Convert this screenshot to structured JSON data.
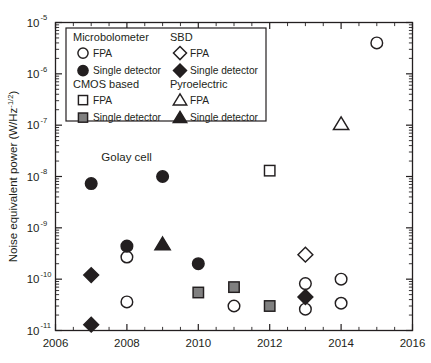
{
  "chart_data": {
    "type": "scatter",
    "title": "",
    "xlabel": "",
    "ylabel": "Noise equivalent power (W/Hz",
    "ylabel_sup": "-1/2",
    "ylabel_tail": ")",
    "xlim": [
      2006,
      2016
    ],
    "ylim": [
      1e-11,
      1e-05
    ],
    "yscale": "log",
    "xticks": [
      "2006",
      "2008",
      "2010",
      "2012",
      "2014",
      "2016"
    ],
    "xtick_values": [
      2006,
      2008,
      2010,
      2012,
      2014,
      2016
    ],
    "ytick_labels": [
      "10",
      "10",
      "10",
      "10",
      "10",
      "10",
      "10"
    ],
    "ytick_exponents": [
      "-5",
      "-6",
      "-7",
      "-8",
      "-9",
      "-10",
      "-11"
    ],
    "ytick_values": [
      1e-05,
      1e-06,
      1e-07,
      1e-08,
      1e-09,
      1e-10,
      1e-11
    ],
    "grid": false,
    "annotations": [
      {
        "text": "Golay cell",
        "x": 2009,
        "y": 1e-08,
        "dx": -36,
        "dy": -16
      }
    ],
    "legend_position": "upper-left-inside",
    "colors": {
      "outline": "#231f20",
      "filled": "#231f20",
      "grey_fill": "#808080",
      "open_fill": "#ffffff"
    },
    "series": [
      {
        "name": "Microbolometer FPA",
        "marker": "circle",
        "fill": "open",
        "points": [
          {
            "x": 2008,
            "y": 2.7e-10
          },
          {
            "x": 2008,
            "y": 3.6e-11
          },
          {
            "x": 2011,
            "y": 3e-11
          },
          {
            "x": 2013,
            "y": 8.2e-11
          },
          {
            "x": 2013,
            "y": 2.6e-11
          },
          {
            "x": 2014,
            "y": 1e-10
          },
          {
            "x": 2014,
            "y": 3.4e-11
          },
          {
            "x": 2015,
            "y": 4e-06
          }
        ]
      },
      {
        "name": "Microbolometer Single detector",
        "marker": "circle",
        "fill": "filled",
        "points": [
          {
            "x": 2007,
            "y": 7.3e-09
          },
          {
            "x": 2008,
            "y": 4.4e-10
          },
          {
            "x": 2009,
            "y": 1e-08
          },
          {
            "x": 2010,
            "y": 2e-10
          }
        ]
      },
      {
        "name": "CMOS based FPA",
        "marker": "square",
        "fill": "open",
        "points": [
          {
            "x": 2012,
            "y": 1.3e-08
          }
        ]
      },
      {
        "name": "CMOS based Single detector",
        "marker": "square",
        "fill": "grey",
        "points": [
          {
            "x": 2010,
            "y": 5.5e-11
          },
          {
            "x": 2011,
            "y": 7e-11
          },
          {
            "x": 2012,
            "y": 3e-11
          }
        ]
      },
      {
        "name": "SBD FPA",
        "marker": "diamond",
        "fill": "open",
        "points": [
          {
            "x": 2013,
            "y": 3e-10
          }
        ]
      },
      {
        "name": "SBD Single detector",
        "marker": "diamond",
        "fill": "filled",
        "points": [
          {
            "x": 2007,
            "y": 1.2e-10
          },
          {
            "x": 2007,
            "y": 1.3e-11
          },
          {
            "x": 2013,
            "y": 4.5e-11
          }
        ]
      },
      {
        "name": "Pyroelectric FPA",
        "marker": "triangle",
        "fill": "open",
        "points": [
          {
            "x": 2014,
            "y": 1.05e-07
          }
        ]
      },
      {
        "name": "Pyroelectric Single detector",
        "marker": "triangle",
        "fill": "filled",
        "points": [
          {
            "x": 2009,
            "y": 4.8e-10
          }
        ]
      }
    ],
    "legend": {
      "groups": [
        {
          "heading": "Microbolometer",
          "items": [
            {
              "label": "FPA",
              "marker": "circle",
              "fill": "open"
            },
            {
              "label": "Single detector",
              "marker": "circle",
              "fill": "filled"
            }
          ]
        },
        {
          "heading": "SBD",
          "items": [
            {
              "label": "FPA",
              "marker": "diamond",
              "fill": "open"
            },
            {
              "label": "Single detector",
              "marker": "diamond",
              "fill": "filled"
            }
          ]
        },
        {
          "heading": "CMOS based",
          "items": [
            {
              "label": "FPA",
              "marker": "square",
              "fill": "open"
            },
            {
              "label": "Single detector",
              "marker": "square",
              "fill": "grey"
            }
          ]
        },
        {
          "heading": "Pyroelectric",
          "items": [
            {
              "label": "FPA",
              "marker": "triangle",
              "fill": "open"
            },
            {
              "label": "Single detector",
              "marker": "triangle",
              "fill": "filled"
            }
          ]
        }
      ]
    }
  }
}
